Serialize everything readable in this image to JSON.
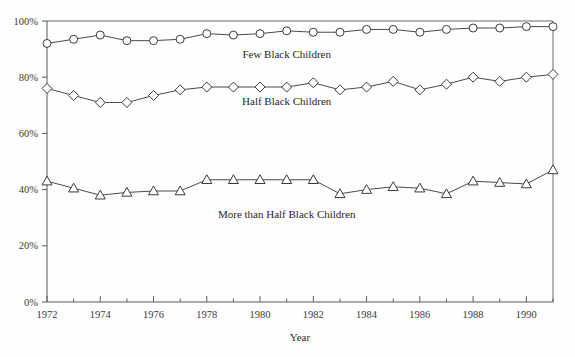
{
  "chart_data": {
    "type": "line",
    "title": "",
    "subtitle": "",
    "xlabel": "Year",
    "ylabel": "",
    "grid": false,
    "legend_position": "inline-annotations",
    "x": [
      1972,
      1973,
      1974,
      1975,
      1976,
      1977,
      1978,
      1979,
      1980,
      1981,
      1982,
      1983,
      1984,
      1985,
      1986,
      1987,
      1988,
      1989,
      1990,
      1991
    ],
    "xlim": [
      1972,
      1991
    ],
    "ylim": [
      0,
      100
    ],
    "y_tick_labels": [
      "0%",
      "20%",
      "40%",
      "60%",
      "80%",
      "100%"
    ],
    "y_tick_values": [
      0,
      20,
      40,
      60,
      80,
      100
    ],
    "x_tick_labels": [
      "1972",
      "1974",
      "1976",
      "1978",
      "1980",
      "1982",
      "1984",
      "1986",
      "1988",
      "1990"
    ],
    "x_tick_values": [
      1972,
      1974,
      1976,
      1978,
      1980,
      1982,
      1984,
      1986,
      1988,
      1990
    ],
    "x_minor_ticks": [
      1973,
      1975,
      1977,
      1979,
      1981,
      1983,
      1985,
      1987,
      1989,
      1991
    ],
    "series": [
      {
        "name": "Few Black Children",
        "marker": "circle",
        "label_x": 1981,
        "label_y": 87,
        "values": [
          92.0,
          93.5,
          95.0,
          93.0,
          93.0,
          93.5,
          95.5,
          95.0,
          95.5,
          96.5,
          96.0,
          96.0,
          97.0,
          97.0,
          96.0,
          97.0,
          97.5,
          97.5,
          98.0,
          98.0
        ]
      },
      {
        "name": "Half Black Children",
        "marker": "diamond",
        "label_x": 1981,
        "label_y": 70,
        "values": [
          76.0,
          73.5,
          71.0,
          71.0,
          73.5,
          75.5,
          76.5,
          76.5,
          76.5,
          76.5,
          78.0,
          75.5,
          76.5,
          78.5,
          75.5,
          77.5,
          80.0,
          78.5,
          80.0,
          81.0
        ]
      },
      {
        "name": "More than Half Black Children",
        "marker": "triangle",
        "label_x": 1981,
        "label_y": 30,
        "values": [
          43.0,
          40.5,
          38.0,
          39.0,
          39.5,
          39.5,
          43.5,
          43.5,
          43.5,
          43.5,
          43.5,
          38.5,
          40.0,
          41.0,
          40.5,
          38.5,
          43.0,
          42.5,
          42.0,
          47.0
        ]
      }
    ]
  }
}
